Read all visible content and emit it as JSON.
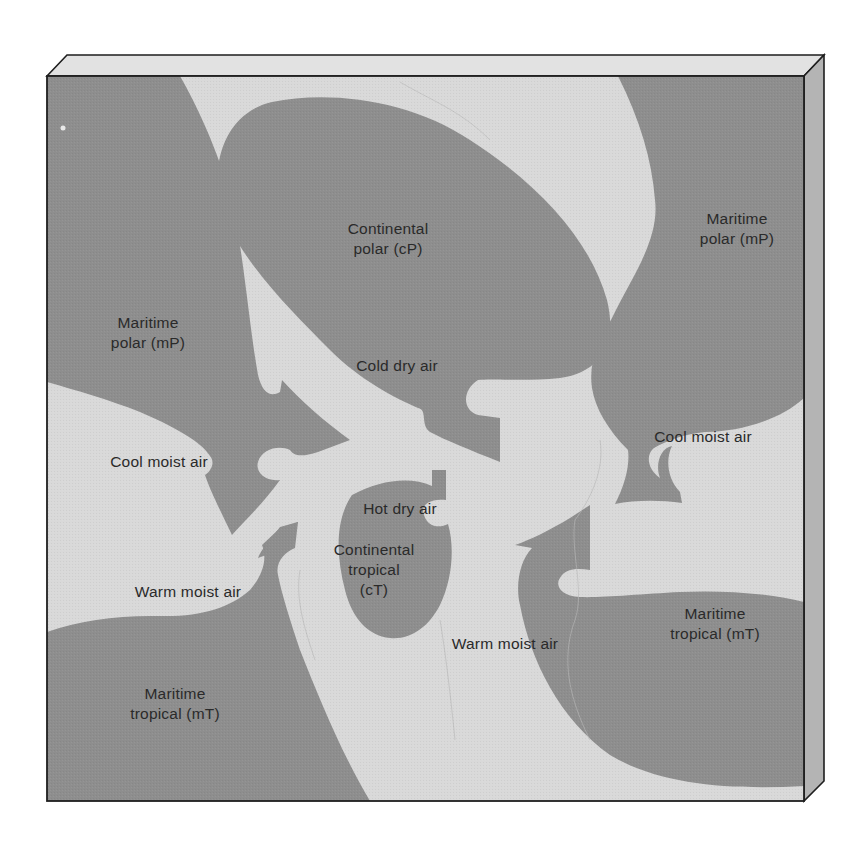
{
  "colors": {
    "background": "#ffffff",
    "light_region": "#d9d9d9",
    "dark_region": "#8e8e8e",
    "top_face": "#e2e2e2",
    "side_face": "#b4b4b4",
    "outline": "#1e1e1e",
    "text": "#2a2a2a"
  },
  "air_masses": [
    {
      "id": "cP",
      "lines": [
        "Continental",
        "polar (cP)"
      ]
    },
    {
      "id": "mP-west",
      "lines": [
        "Maritime",
        "polar (mP)"
      ]
    },
    {
      "id": "mP-east",
      "lines": [
        "Maritime",
        "polar (mP)"
      ]
    },
    {
      "id": "cT",
      "lines": [
        "Continental",
        "tropical",
        "(cT)"
      ]
    },
    {
      "id": "mT-west",
      "lines": [
        "Maritime",
        "tropical (mT)"
      ]
    },
    {
      "id": "mT-east",
      "lines": [
        "Maritime",
        "tropical (mT)"
      ]
    }
  ],
  "flows": [
    {
      "id": "cold-dry",
      "label": "Cold dry air"
    },
    {
      "id": "cool-moist-west",
      "label": "Cool moist air"
    },
    {
      "id": "cool-moist-east",
      "label": "Cool moist air"
    },
    {
      "id": "hot-dry",
      "label": "Hot dry air"
    },
    {
      "id": "warm-moist-west",
      "label": "Warm moist air"
    },
    {
      "id": "warm-moist-east",
      "label": "Warm moist air"
    }
  ]
}
